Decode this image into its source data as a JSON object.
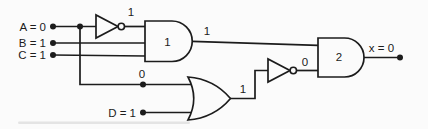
{
  "circuit": {
    "description": "two-level logic gate circuit",
    "colors": {
      "line": "#1c1c1c",
      "background": "#fbfbfb"
    },
    "inputs": {
      "a": "A = 0",
      "b": "B = 1",
      "c": "C = 1",
      "d": "D = 1"
    },
    "output": "x = 0",
    "gates": {
      "not1": {
        "type": "inverter"
      },
      "and1": {
        "type": "and",
        "label": "1"
      },
      "or1": {
        "type": "or"
      },
      "not2": {
        "type": "inverter"
      },
      "and2": {
        "type": "and",
        "label": "2"
      }
    },
    "signals": {
      "not1_output": "1",
      "and1_output": "1",
      "a_branch": "0",
      "or1_output": "1",
      "not2_output": "0"
    }
  }
}
